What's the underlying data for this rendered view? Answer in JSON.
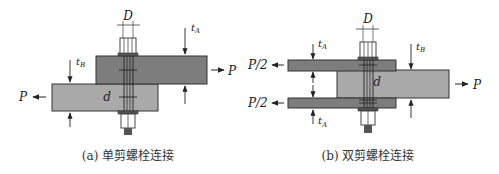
{
  "diagram_a": {
    "caption": "(a) 单剪螺栓连接",
    "labels": {
      "bolt_diameter": "D",
      "shank_diameter": "d",
      "thickness_top": "t",
      "thickness_top_sub": "A",
      "thickness_bottom": "t",
      "thickness_bottom_sub": "B",
      "force_right": "P",
      "force_left": "P"
    },
    "colors": {
      "plate_top": "#7d7d7d",
      "plate_bottom": "#a9a9a9",
      "bolt": "#ffffff",
      "nut_tip": "#555555"
    }
  },
  "diagram_b": {
    "caption": "(b) 双剪螺栓连接",
    "labels": {
      "bolt_diameter": "D",
      "shank_diameter": "d",
      "thickness_outer_top": "t",
      "thickness_outer_top_sub": "A",
      "thickness_outer_bottom": "t",
      "thickness_outer_bottom_sub": "A",
      "thickness_middle": "t",
      "thickness_middle_sub": "B",
      "force_top_left": "P/2",
      "force_bottom_left": "P/2",
      "force_right": "P"
    },
    "colors": {
      "plate_outer": "#7d7d7d",
      "plate_middle": "#a9a9a9",
      "bolt": "#ffffff",
      "nut_tip": "#555555"
    }
  }
}
